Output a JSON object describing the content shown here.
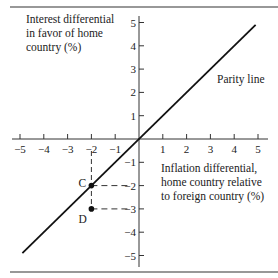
{
  "chart_data": {
    "type": "line",
    "title": "",
    "xlabel": "Inflation differential, home country relative to foreign country (%)",
    "ylabel": "Interest differential in favor of home country (%)",
    "xlabel_lines": [
      "Inflation differential,",
      "home country relative",
      "to foreign country (%)"
    ],
    "ylabel_lines": [
      "Interest differential",
      "in favor of home",
      "country (%)"
    ],
    "xlim": [
      -5,
      5
    ],
    "ylim": [
      -5,
      5
    ],
    "x_ticks": [
      -5,
      -4,
      -3,
      -2,
      -1,
      1,
      2,
      3,
      4,
      5
    ],
    "y_ticks": [
      5,
      4,
      3,
      2,
      1,
      -1,
      -2,
      -3,
      -4,
      -5
    ],
    "x_tick_labels": [
      "−5",
      "−4",
      "−3",
      "−2",
      "−1",
      "1",
      "2",
      "3",
      "4",
      "5"
    ],
    "y_tick_labels": [
      "5",
      "4",
      "3",
      "2",
      "1",
      "−1",
      "−2",
      "−3",
      "−4",
      "−5"
    ],
    "grid": false,
    "series": [
      {
        "name": "Parity line",
        "x": [
          -4.9,
          4.9
        ],
        "y": [
          -4.9,
          4.9
        ]
      }
    ],
    "points": [
      {
        "label": "C",
        "x": -2,
        "y": -2
      },
      {
        "label": "D",
        "x": -2,
        "y": -3
      }
    ],
    "annotations": [
      {
        "text": "Parity line",
        "x": 3.3,
        "y": 2.3
      }
    ]
  }
}
